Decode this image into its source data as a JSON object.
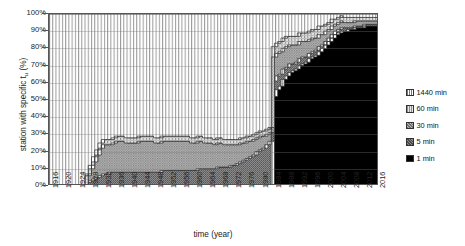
{
  "chart_data": {
    "type": "area",
    "title": "",
    "xlabel": "time (year)",
    "ylabel": "station with specific t_u (%)",
    "ylabel_main": "station with specific t",
    "ylabel_sub": "u",
    "ylabel_unit": " (%)",
    "stacked": true,
    "normalized_percent": true,
    "grid": true,
    "legend_position": "right",
    "ylim": [
      0,
      100
    ],
    "yticks": [
      "0%",
      "10%",
      "20%",
      "30%",
      "40%",
      "50%",
      "60%",
      "70%",
      "80%",
      "90%",
      "100%"
    ],
    "ytick_values": [
      0,
      10,
      20,
      30,
      40,
      50,
      60,
      70,
      80,
      90,
      100
    ],
    "xlim": [
      1916,
      2017
    ],
    "xticks": [
      1916,
      1920,
      1924,
      1928,
      1932,
      1936,
      1940,
      1944,
      1948,
      1952,
      1956,
      1960,
      1964,
      1968,
      1972,
      1976,
      1980,
      1984,
      1988,
      1992,
      1996,
      2000,
      2004,
      2008,
      2012,
      2016
    ],
    "x": [
      1916,
      1917,
      1918,
      1919,
      1920,
      1921,
      1922,
      1923,
      1924,
      1925,
      1926,
      1927,
      1928,
      1929,
      1930,
      1931,
      1932,
      1933,
      1934,
      1935,
      1936,
      1937,
      1938,
      1939,
      1940,
      1941,
      1942,
      1943,
      1944,
      1945,
      1946,
      1947,
      1948,
      1949,
      1950,
      1951,
      1952,
      1953,
      1954,
      1955,
      1956,
      1957,
      1958,
      1959,
      1960,
      1961,
      1962,
      1963,
      1964,
      1965,
      1966,
      1967,
      1968,
      1969,
      1970,
      1971,
      1972,
      1973,
      1974,
      1975,
      1976,
      1977,
      1978,
      1979,
      1980,
      1981,
      1982,
      1983,
      1984,
      1985,
      1986,
      1987,
      1988,
      1989,
      1990,
      1991,
      1992,
      1993,
      1994,
      1995,
      1996,
      1997,
      1998,
      1999,
      2000,
      2001,
      2002,
      2003,
      2004,
      2005,
      2006,
      2007,
      2008,
      2009,
      2010,
      2011,
      2012,
      2013,
      2014,
      2015,
      2016,
      2017
    ],
    "series": [
      {
        "name": "1 min",
        "color": "#000000",
        "pattern": "solid-black",
        "values": [
          0,
          0,
          0,
          0,
          0,
          0,
          0,
          0,
          0,
          0,
          0,
          0,
          0,
          0,
          0,
          0,
          0,
          0,
          0,
          0,
          0,
          0,
          0,
          0,
          0,
          0,
          0,
          0,
          0,
          0,
          0,
          0,
          0,
          0,
          0,
          0,
          0,
          0,
          0,
          0,
          0,
          0,
          0,
          0,
          0,
          0,
          0,
          0,
          0,
          0,
          0,
          0,
          0,
          0,
          0,
          0,
          0,
          0,
          0,
          0,
          0,
          0,
          0,
          0,
          0,
          0,
          0,
          0,
          0,
          52,
          56,
          58,
          62,
          64,
          66,
          67,
          68,
          70,
          71,
          72,
          74,
          75,
          76,
          78,
          80,
          82,
          84,
          86,
          88,
          89,
          90,
          90,
          91,
          91,
          92,
          92,
          92,
          93,
          93,
          93,
          93,
          93
        ]
      },
      {
        "name": "5 min",
        "color": "#6e6e6e",
        "pattern": "fine-dot",
        "values": [
          0,
          0,
          0,
          0,
          0,
          0,
          0,
          0,
          0,
          0,
          0,
          0,
          2,
          3,
          4,
          5,
          6,
          7,
          7,
          8,
          8,
          8,
          8,
          8,
          8,
          8,
          8,
          8,
          8,
          8,
          8,
          8,
          8,
          8,
          8,
          9,
          9,
          9,
          9,
          9,
          9,
          9,
          9,
          9,
          9,
          9,
          10,
          10,
          10,
          10,
          10,
          10,
          11,
          11,
          11,
          11,
          12,
          12,
          13,
          14,
          15,
          16,
          17,
          18,
          20,
          21,
          22,
          24,
          26,
          9,
          8,
          7,
          6,
          5,
          5,
          4,
          4,
          4,
          4,
          3,
          3,
          3,
          3,
          3,
          2,
          2,
          2,
          2,
          2,
          2,
          2,
          2,
          1,
          1,
          1,
          1,
          1,
          1,
          1,
          1,
          1,
          1
        ]
      },
      {
        "name": "30 min",
        "color": "#a8a8a8",
        "pattern": "mid-dot",
        "values": [
          0,
          0,
          0,
          0,
          0,
          0,
          0,
          0,
          0,
          0,
          0,
          0,
          4,
          7,
          10,
          13,
          16,
          17,
          17,
          16,
          17,
          18,
          18,
          18,
          17,
          17,
          17,
          17,
          18,
          18,
          18,
          18,
          18,
          17,
          17,
          17,
          17,
          17,
          17,
          17,
          17,
          17,
          17,
          17,
          16,
          16,
          16,
          16,
          15,
          15,
          15,
          14,
          14,
          14,
          13,
          13,
          12,
          12,
          11,
          11,
          10,
          10,
          9,
          9,
          8,
          8,
          7,
          6,
          5,
          14,
          13,
          13,
          12,
          12,
          11,
          11,
          10,
          10,
          9,
          9,
          8,
          8,
          7,
          7,
          6,
          6,
          5,
          5,
          4,
          4,
          4,
          3,
          3,
          3,
          3,
          3,
          3,
          2,
          2,
          2,
          2,
          2
        ]
      },
      {
        "name": "60 min",
        "color": "#d0d0d0",
        "pattern": "light-dot",
        "values": [
          0,
          0,
          0,
          0,
          0,
          0,
          0,
          0,
          0,
          0,
          0,
          0,
          1,
          2,
          3,
          3,
          3,
          3,
          3,
          3,
          3,
          3,
          3,
          3,
          3,
          3,
          3,
          3,
          3,
          3,
          3,
          3,
          3,
          3,
          3,
          3,
          3,
          3,
          3,
          3,
          3,
          3,
          3,
          3,
          3,
          3,
          3,
          3,
          3,
          3,
          3,
          3,
          3,
          3,
          3,
          3,
          3,
          3,
          3,
          3,
          3,
          3,
          3,
          3,
          3,
          3,
          3,
          3,
          3,
          6,
          6,
          6,
          6,
          6,
          5,
          5,
          5,
          5,
          5,
          5,
          5,
          5,
          5,
          5,
          5,
          4,
          4,
          4,
          3,
          3,
          3,
          3,
          3,
          3,
          2,
          2,
          2,
          2,
          2,
          2,
          2,
          2
        ]
      },
      {
        "name": "1440 min",
        "color": "#ffffff",
        "pattern": "vertical-lines",
        "values": [
          100,
          100,
          100,
          100,
          100,
          100,
          100,
          100,
          100,
          100,
          100,
          100,
          93,
          88,
          83,
          79,
          75,
          73,
          73,
          73,
          72,
          71,
          71,
          71,
          72,
          72,
          72,
          72,
          71,
          71,
          71,
          71,
          71,
          72,
          72,
          71,
          71,
          71,
          71,
          71,
          71,
          71,
          71,
          71,
          72,
          72,
          71,
          71,
          72,
          72,
          72,
          73,
          72,
          72,
          73,
          73,
          73,
          73,
          73,
          72,
          72,
          71,
          71,
          70,
          69,
          68,
          68,
          67,
          66,
          19,
          17,
          16,
          14,
          13,
          13,
          13,
          13,
          11,
          11,
          11,
          10,
          9,
          9,
          7,
          7,
          6,
          5,
          3,
          3,
          2,
          1,
          2,
          2,
          2,
          2,
          2,
          2,
          2,
          2,
          2,
          2,
          2
        ]
      }
    ]
  },
  "legend": {
    "items": [
      {
        "label": "1440 min",
        "swatch": "vertical-lines"
      },
      {
        "label": "60 min",
        "swatch": "light-dot"
      },
      {
        "label": "30 min",
        "swatch": "mid-dot"
      },
      {
        "label": "5 min",
        "swatch": "fine-dot"
      },
      {
        "label": "1 min",
        "swatch": "solid-black"
      }
    ]
  }
}
